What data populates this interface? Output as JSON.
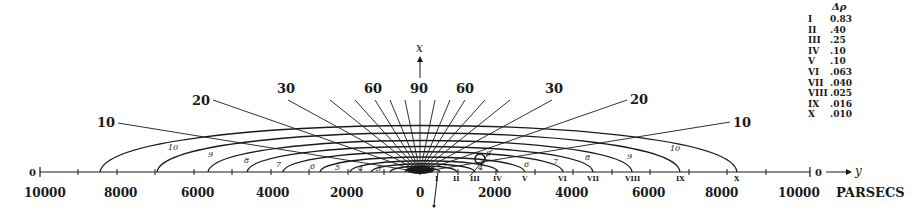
{
  "figure": {
    "axis_x_label": "x",
    "axis_y_label": "y",
    "units_label": "PARSECS",
    "origin_center_label": "0",
    "end_zero_left": "0",
    "end_zero_right": "0",
    "ticks_left": [
      "10000",
      "8000",
      "6000",
      "4000",
      "2000"
    ],
    "tick_center": "0",
    "ticks_right": [
      "2000",
      "4000",
      "6000",
      "8000",
      "10000"
    ],
    "angle_labels_left": [
      "10",
      "20",
      "30",
      "60"
    ],
    "angle_label_top": "90",
    "angle_labels_right": [
      "60",
      "30",
      "20",
      "10"
    ],
    "ellipse_numbers_left": [
      "10",
      "9",
      "8",
      "7",
      "6",
      "5",
      "4",
      "3"
    ],
    "ellipse_numbers_right": [
      "4",
      "6",
      "7",
      "8",
      "9",
      "10"
    ],
    "roman_axis_labels": [
      "I",
      "II",
      "III",
      "IV",
      "V",
      "VI",
      "VII",
      "VIII",
      "IX",
      "X"
    ],
    "sun_marker_label": "S"
  },
  "legend": {
    "header": "Δρ",
    "rows": [
      {
        "num": "I",
        "val": "0.83"
      },
      {
        "num": "II",
        "val": ".40"
      },
      {
        "num": "III",
        "val": ".25"
      },
      {
        "num": "IV",
        "val": ".10"
      },
      {
        "num": "V",
        "val": ".10"
      },
      {
        "num": "VI",
        "val": ".063"
      },
      {
        "num": "VII",
        "val": ".040"
      },
      {
        "num": "VIII",
        "val": ".025"
      },
      {
        "num": "IX",
        "val": ".016"
      },
      {
        "num": "X",
        "val": ".010"
      }
    ]
  },
  "colors": {
    "ink": "#1a1a1a",
    "paper": "#ffffff"
  }
}
